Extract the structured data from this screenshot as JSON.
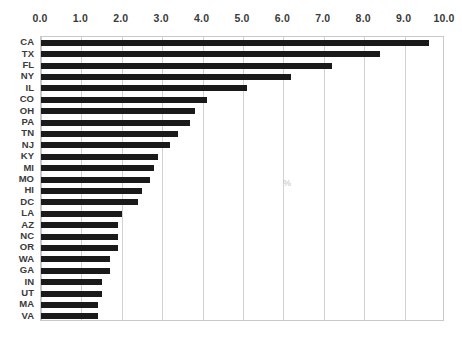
{
  "chart_data": {
    "type": "bar",
    "orientation": "horizontal",
    "title": "",
    "subtitle": "",
    "xlabel": "%",
    "ylabel": "",
    "xlim": [
      0.0,
      10.0
    ],
    "xticks": [
      "0.0",
      "1.0",
      "2.0",
      "3.0",
      "4.0",
      "5.0",
      "6.0",
      "7.0",
      "8.0",
      "9.0",
      "10.0"
    ],
    "xtick_values": [
      0,
      1,
      2,
      3,
      4,
      5,
      6,
      7,
      8,
      9,
      10
    ],
    "grid": true,
    "grid_axis": "x",
    "legend": false,
    "legend_position": "none",
    "bar_color": "#1a1a1a",
    "grid_color": "#d2d2d2",
    "frame_color": "#c9c9c9",
    "categories": [
      "CA",
      "TX",
      "FL",
      "NY",
      "IL",
      "CO",
      "OH",
      "PA",
      "TN",
      "NJ",
      "KY",
      "MI",
      "MO",
      "HI",
      "DC",
      "LA",
      "AZ",
      "NC",
      "OR",
      "WA",
      "GA",
      "IN",
      "UT",
      "MA",
      "VA"
    ],
    "values": [
      9.6,
      8.4,
      7.2,
      6.2,
      5.1,
      4.1,
      3.8,
      3.7,
      3.4,
      3.2,
      2.9,
      2.8,
      2.7,
      2.5,
      2.4,
      2.0,
      1.9,
      1.9,
      1.9,
      1.7,
      1.7,
      1.5,
      1.5,
      1.4,
      1.4
    ],
    "annotations": [
      {
        "text": "%",
        "x": 6.0,
        "note": "faint unit label inside plot area"
      }
    ]
  },
  "caption": {
    "clipped_text": ""
  }
}
